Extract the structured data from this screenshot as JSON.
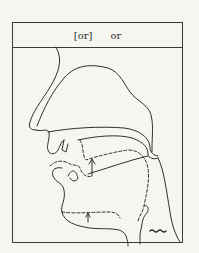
{
  "figure": {
    "title": {
      "phonetic": "[or]",
      "spelling": "or"
    },
    "colors": {
      "background": "#f6f5ef",
      "ink": "#2f2f2f"
    },
    "annotations": [
      {
        "name": "tongue-raise-arrow",
        "type": "arrow",
        "direction": "up"
      },
      {
        "name": "jaw-raise-arrow",
        "type": "arrow",
        "direction": "up"
      },
      {
        "name": "voicing-mark",
        "type": "wavy-line"
      }
    ]
  }
}
